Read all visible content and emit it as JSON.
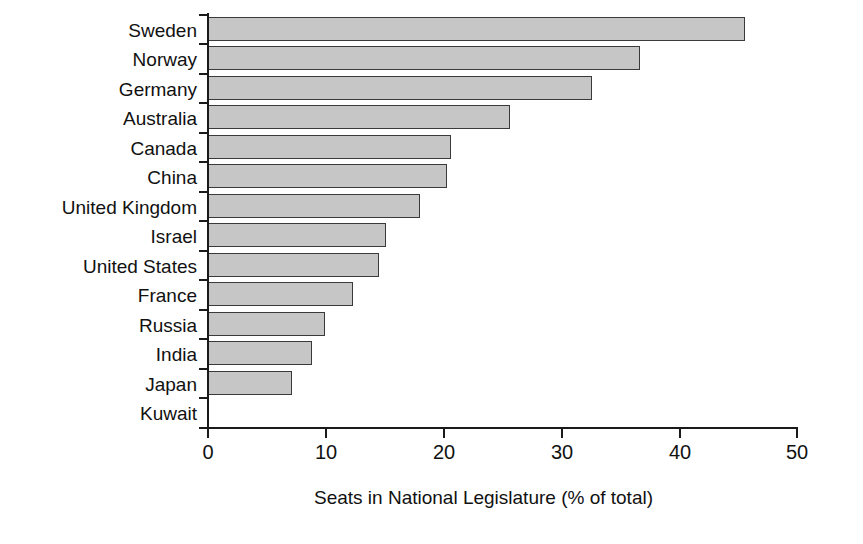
{
  "chart_data": {
    "type": "bar",
    "orientation": "horizontal",
    "title": "",
    "subtitle": "",
    "xlabel": "Seats in National Legislature (% of total)",
    "ylabel": "",
    "xlim": [
      0,
      50
    ],
    "xticks": [
      0,
      10,
      20,
      30,
      40,
      50
    ],
    "xtick_labels": [
      "0",
      "10",
      "20",
      "30",
      "40",
      "50"
    ],
    "grid": false,
    "legend": null,
    "bar_fill_color": "#c6c6c6",
    "bar_edge_color": "#3a3a3a",
    "axis_color": "#1a1a1a",
    "categories": [
      "Sweden",
      "Norway",
      "Germany",
      "Australia",
      "Canada",
      "China",
      "United Kingdom",
      "Israel",
      "United States",
      "France",
      "Russia",
      "India",
      "Japan",
      "Kuwait"
    ],
    "values": [
      45.6,
      36.7,
      32.6,
      25.6,
      20.6,
      20.3,
      18.0,
      15.1,
      14.5,
      12.3,
      9.9,
      8.8,
      7.1,
      0.0
    ],
    "series": [
      {
        "name": "Seats in National Legislature (% of total)",
        "values": [
          45.6,
          36.7,
          32.6,
          25.6,
          20.6,
          20.3,
          18.0,
          15.1,
          14.5,
          12.3,
          9.9,
          8.8,
          7.1,
          0.0
        ]
      }
    ]
  }
}
